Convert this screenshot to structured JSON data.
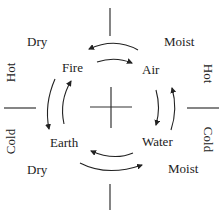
{
  "diagram": {
    "colors": {
      "ink": "#222222",
      "background": "#ffffff"
    },
    "elements": {
      "fire": "Fire",
      "air": "Air",
      "water": "Water",
      "earth": "Earth"
    },
    "qualities": {
      "top_left": "Dry",
      "top_right": "Moist",
      "bottom_left": "Dry",
      "bottom_right": "Moist",
      "left_upper": "Hot",
      "left_lower": "Cold",
      "right_upper": "Hot",
      "right_lower": "Cold"
    },
    "cycle_arrows": [
      {
        "from": "Fire",
        "to": "Air",
        "direction": "clockwise"
      },
      {
        "from": "Air",
        "to": "Fire",
        "direction": "counterclockwise"
      },
      {
        "from": "Air",
        "to": "Water",
        "direction": "clockwise"
      },
      {
        "from": "Water",
        "to": "Air",
        "direction": "counterclockwise"
      },
      {
        "from": "Water",
        "to": "Earth",
        "direction": "clockwise"
      },
      {
        "from": "Earth",
        "to": "Water",
        "direction": "counterclockwise"
      },
      {
        "from": "Earth",
        "to": "Fire",
        "direction": "clockwise"
      },
      {
        "from": "Fire",
        "to": "Earth",
        "direction": "counterclockwise"
      }
    ]
  }
}
